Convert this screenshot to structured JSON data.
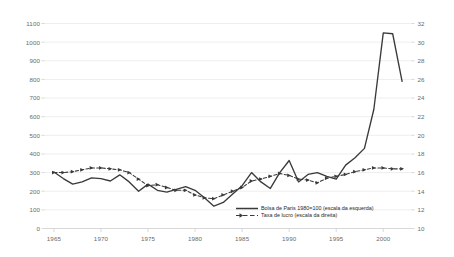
{
  "chart_data": {
    "type": "line",
    "title": "",
    "subtitle": "",
    "xlabel": "",
    "ylabel": "",
    "grid": true,
    "legend_position": "inside-bottom-center",
    "x": [
      1965,
      1966,
      1967,
      1968,
      1969,
      1970,
      1971,
      1972,
      1973,
      1974,
      1975,
      1976,
      1977,
      1978,
      1979,
      1980,
      1981,
      1982,
      1983,
      1984,
      1985,
      1986,
      1987,
      1988,
      1989,
      1990,
      1991,
      1992,
      1993,
      1994,
      1995,
      1996,
      1997,
      1998,
      1999,
      2000,
      2001,
      2002
    ],
    "xlim": [
      1964,
      2003
    ],
    "xticks": [
      1965,
      1970,
      1975,
      1980,
      1985,
      1990,
      1995,
      2000
    ],
    "xticklabels": [
      "1965",
      "1970",
      "1975",
      "1980",
      "1985",
      "1990",
      "1995",
      "2000"
    ],
    "axes": [
      {
        "id": "left",
        "name": "Bolsa de Paris 1980=100",
        "ylim": [
          0,
          1100
        ],
        "yticks": [
          0,
          100,
          200,
          300,
          400,
          500,
          600,
          700,
          800,
          900,
          1000,
          1100
        ],
        "yticklabels": [
          "0",
          "100",
          "200",
          "300",
          "400",
          "500",
          "600",
          "700",
          "800",
          "900",
          "1000",
          "1100"
        ]
      },
      {
        "id": "right",
        "name": "Taxa de lucro",
        "ylim": [
          10,
          32
        ],
        "yticks": [
          10,
          12,
          14,
          16,
          18,
          20,
          22,
          24,
          26,
          28,
          30,
          32
        ],
        "yticklabels": [
          "10",
          "12",
          "14",
          "16",
          "18",
          "20",
          "22",
          "24",
          "26",
          "28",
          "30",
          "32"
        ]
      }
    ],
    "series": [
      {
        "name": "Bolsa de Paris 1980=100 (escala da esquerda)",
        "axis": "left",
        "style": "solid",
        "marker": "none",
        "color": "#3a3a3a",
        "values": [
          303,
          268,
          238,
          250,
          272,
          268,
          255,
          288,
          250,
          200,
          238,
          205,
          195,
          210,
          225,
          205,
          165,
          120,
          140,
          185,
          230,
          300,
          250,
          215,
          300,
          365,
          250,
          290,
          300,
          280,
          265,
          340,
          380,
          430,
          640,
          1050,
          1045,
          790
        ]
      },
      {
        "name": "Taxa de lucro (escala da direita)",
        "axis": "right",
        "style": "dashed",
        "marker": "triangle",
        "color": "#3a3a3a",
        "values": [
          16.0,
          16.0,
          16.1,
          16.3,
          16.5,
          16.5,
          16.4,
          16.3,
          16.0,
          15.3,
          14.6,
          14.7,
          14.4,
          14.1,
          14.1,
          13.6,
          13.3,
          13.2,
          13.6,
          14.0,
          14.4,
          15.1,
          15.3,
          15.6,
          15.9,
          15.7,
          15.3,
          15.2,
          14.9,
          15.4,
          15.6,
          15.8,
          16.1,
          16.3,
          16.5,
          16.5,
          16.4,
          16.4
        ]
      }
    ],
    "annotations": []
  },
  "legend": {
    "items": [
      {
        "label": "Bolsa de Paris 1980=100 (escala da esquerda)",
        "style": "solid"
      },
      {
        "label": "Taxa de lucro (escala da direita)",
        "style": "dashed-marker"
      }
    ]
  }
}
